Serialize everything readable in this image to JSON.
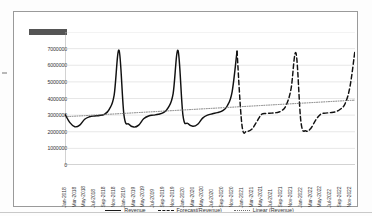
{
  "chart_data": {
    "type": "line",
    "title": "",
    "xlabel": "",
    "ylabel": "",
    "ylim": [
      0,
      8000000
    ],
    "ytick_step": 1000000,
    "ytick_labels": [
      "8000000",
      "7000000",
      "6000000",
      "5000000",
      "4000000",
      "3000000",
      "2000000",
      "1000000",
      "0"
    ],
    "grid": true,
    "legend_position": "bottom",
    "x_tick_labels": [
      "Jan-2018",
      "Mar-2018",
      "May-2018",
      "Jul-2018",
      "Sep-2018",
      "Nov-2018",
      "Jan-2019",
      "Mar-2019",
      "May-2019",
      "Jul-2019",
      "Sep-2019",
      "Nov-2019",
      "Jan-2020",
      "Mar-2020",
      "May-2020",
      "Jul-2020",
      "Sep-2020",
      "Nov-2020",
      "Jan-2021",
      "Mar-2021",
      "May-2021",
      "Jul-2021",
      "Sep-2021",
      "Nov-2021",
      "Jan-2022",
      "Mar-2022",
      "May-2022",
      "Jul-2022",
      "Sep-2022",
      "Nov-2022"
    ],
    "x": [
      "Jan-2018",
      "Feb-2018",
      "Mar-2018",
      "Apr-2018",
      "May-2018",
      "Jun-2018",
      "Jul-2018",
      "Aug-2018",
      "Sep-2018",
      "Oct-2018",
      "Nov-2018",
      "Dec-2018",
      "Jan-2019",
      "Feb-2019",
      "Mar-2019",
      "Apr-2019",
      "May-2019",
      "Jun-2019",
      "Jul-2019",
      "Aug-2019",
      "Sep-2019",
      "Oct-2019",
      "Nov-2019",
      "Dec-2019",
      "Jan-2020",
      "Feb-2020",
      "Mar-2020",
      "Apr-2020",
      "May-2020",
      "Jun-2020",
      "Jul-2020",
      "Aug-2020",
      "Sep-2020",
      "Oct-2020",
      "Nov-2020",
      "Dec-2020",
      "Jan-2021",
      "Feb-2021",
      "Mar-2021",
      "Apr-2021",
      "May-2021",
      "Jun-2021",
      "Jul-2021",
      "Aug-2021",
      "Sep-2021",
      "Oct-2021",
      "Nov-2021",
      "Dec-2021",
      "Jan-2022",
      "Feb-2022",
      "Mar-2022",
      "Apr-2022",
      "May-2022",
      "Jun-2022",
      "Jul-2022",
      "Aug-2022",
      "Sep-2022",
      "Oct-2022",
      "Nov-2022",
      "Dec-2022"
    ],
    "series": [
      {
        "name": "Revenue",
        "style": "solid",
        "color": "#111111",
        "values": [
          3050000,
          2550000,
          2300000,
          2400000,
          2750000,
          2900000,
          2950000,
          2980000,
          3050000,
          3350000,
          4200000,
          6900000,
          3000000,
          2450000,
          2280000,
          2400000,
          2780000,
          2950000,
          3000000,
          3050000,
          3150000,
          3450000,
          4300000,
          6880000,
          2980000,
          2500000,
          2330000,
          2450000,
          2820000,
          3000000,
          3080000,
          3150000,
          3250000,
          3550000,
          4400000,
          6850000,
          null,
          null,
          null,
          null,
          null,
          null,
          null,
          null,
          null,
          null,
          null,
          null,
          null,
          null,
          null,
          null,
          null,
          null,
          null,
          null,
          null,
          null,
          null,
          null
        ]
      },
      {
        "name": "Forecast(Revenue)",
        "style": "dashed",
        "color": "#111111",
        "values": [
          null,
          null,
          null,
          null,
          null,
          null,
          null,
          null,
          null,
          null,
          null,
          null,
          null,
          null,
          null,
          null,
          null,
          null,
          null,
          null,
          null,
          null,
          null,
          null,
          null,
          null,
          null,
          null,
          null,
          null,
          null,
          null,
          null,
          null,
          null,
          6850000,
          2400000,
          2050000,
          2150000,
          2600000,
          3050000,
          3100000,
          3120000,
          3150000,
          3250000,
          3600000,
          4600000,
          6720000,
          2600000,
          2050000,
          2200000,
          2700000,
          3050000,
          3120000,
          3150000,
          3200000,
          3350000,
          3700000,
          4750000,
          6900000
        ]
      },
      {
        "name": "Linear (Revenue)",
        "style": "dotted",
        "color": "#6d6d6d",
        "values": [
          2900000,
          2917000,
          2934000,
          2951000,
          2968000,
          2985000,
          3002000,
          3019000,
          3036000,
          3053000,
          3070000,
          3087000,
          3104000,
          3121000,
          3138000,
          3155000,
          3172000,
          3189000,
          3206000,
          3223000,
          3240000,
          3257000,
          3274000,
          3291000,
          3308000,
          3325000,
          3342000,
          3359000,
          3376000,
          3393000,
          3410000,
          3427000,
          3444000,
          3461000,
          3478000,
          3495000,
          3512000,
          3529000,
          3546000,
          3563000,
          3580000,
          3597000,
          3614000,
          3631000,
          3648000,
          3665000,
          3682000,
          3699000,
          3716000,
          3733000,
          3750000,
          3767000,
          3784000,
          3801000,
          3818000,
          3835000,
          3852000,
          3869000,
          3886000,
          3903000
        ]
      }
    ],
    "legend": [
      {
        "label": "Revenue",
        "style": "solid"
      },
      {
        "label": "Forecast(Revenue)",
        "style": "dashed"
      },
      {
        "label": "Linear (Revenue)",
        "style": "dotted"
      }
    ]
  }
}
